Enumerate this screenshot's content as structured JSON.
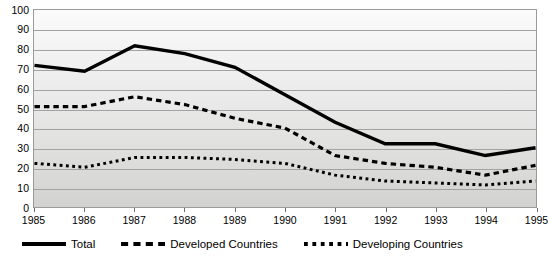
{
  "chart_data": {
    "type": "line",
    "title": "",
    "xlabel": "",
    "ylabel": "",
    "categories": [
      "1985",
      "1986",
      "1987",
      "1988",
      "1989",
      "1990",
      "1991",
      "1992",
      "1993",
      "1994",
      "1995"
    ],
    "x": [
      1985,
      1986,
      1987,
      1988,
      1989,
      1990,
      1991,
      1992,
      1993,
      1994,
      1995
    ],
    "ylim": [
      0,
      100
    ],
    "yticks": [
      0,
      10,
      20,
      30,
      40,
      50,
      60,
      70,
      80,
      90,
      100
    ],
    "grid": true,
    "legend_position": "bottom-left",
    "series": [
      {
        "name": "Total",
        "style": "solid",
        "color": "#000000",
        "values": [
          72,
          69,
          82,
          78,
          71,
          57,
          43,
          32,
          32,
          26,
          30
        ]
      },
      {
        "name": "Developed Countries",
        "style": "dashed",
        "color": "#000000",
        "values": [
          51,
          51,
          56,
          52,
          45,
          40,
          26,
          22,
          20,
          16,
          21
        ]
      },
      {
        "name": "Developing Countries",
        "style": "dotted",
        "color": "#000000",
        "values": [
          22,
          20,
          25,
          25,
          24,
          22,
          16,
          13,
          12,
          11,
          13
        ]
      }
    ]
  },
  "axes": {
    "y_tick_labels": [
      "100",
      "90",
      "80",
      "70",
      "60",
      "50",
      "40",
      "30",
      "20",
      "10",
      "0"
    ],
    "x_tick_labels": [
      "1985",
      "1986",
      "1987",
      "1988",
      "1989",
      "1990",
      "1991",
      "1992",
      "1993",
      "1994",
      "1995"
    ]
  },
  "legend": {
    "items": [
      {
        "label": "Total",
        "style": "solid"
      },
      {
        "label": "Developed Countries",
        "style": "dashed"
      },
      {
        "label": "Developing Countries",
        "style": "dotted"
      }
    ]
  },
  "colors": {
    "line": "#000000",
    "gridline": "#a2a2a2",
    "frame": "#9a9a9a",
    "plot_background_top": "#fbfbfb",
    "plot_background_bottom": "#d2d2d0",
    "text": "#000000"
  }
}
